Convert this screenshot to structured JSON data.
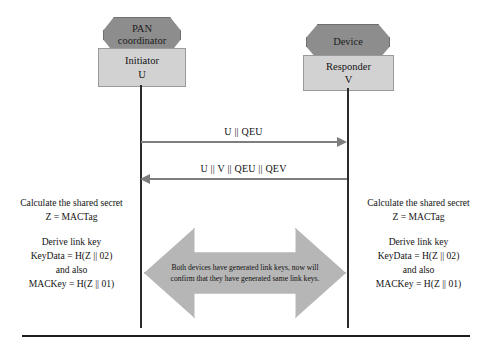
{
  "diagram": {
    "colors": {
      "octagon_fill": "#8d8d8d",
      "box_fill": "#d2d2d2",
      "arrow_gray": "#7e7e7e",
      "block_arrow_fill": "#b6b6b6",
      "lifeline": "#2b2b2b",
      "background": "#ffffff"
    },
    "left_entity": {
      "role_label": "PAN\ncoordinator",
      "role_line1": "PAN",
      "role_line2": "coordinator",
      "box_line1": "Initiator",
      "box_line2": "U"
    },
    "right_entity": {
      "role_label": "Device",
      "box_line1": "Responder",
      "box_line2": "V"
    },
    "messages": [
      {
        "label": "U || QEU",
        "direction": "left-to-right",
        "from": "Initiator U",
        "to": "Responder V"
      },
      {
        "label": "U || V || QEU || QEV",
        "direction": "right-to-left",
        "from": "Responder V",
        "to": "Initiator U"
      }
    ],
    "left_notes": {
      "line1": "Calculate the shared secret",
      "line2": "Z = MACTag",
      "line3": "Derive link key",
      "line4": "KeyData = H(Z || 02)",
      "line5": "and also",
      "line6": "MACKey = H(Z || 01)"
    },
    "right_notes": {
      "line1": "Calculate the shared secret",
      "line2": "Z = MACTag",
      "line3": "Derive link key",
      "line4": "KeyData = H(Z || 02)",
      "line5": "and also",
      "line6": "MACKey = H(Z || 01)"
    },
    "center_annotation": {
      "line1": "Both devices have generated link keys, now will",
      "line2": "confirm that they have generated same link keys."
    }
  }
}
